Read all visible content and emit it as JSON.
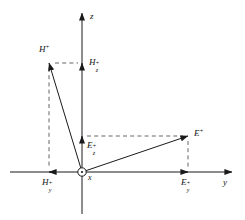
{
  "figure": {
    "background_color": "#ffffff",
    "line_color": "#1a1a1a",
    "dash_color": "#555555",
    "width": 245,
    "height": 220
  },
  "axes": {
    "vertical": {
      "name": "z",
      "label": "z",
      "label_x": 90,
      "label_y": 12,
      "x": 82,
      "top_y": 13,
      "bottom_y": 214,
      "arrow": "up"
    },
    "horizontal": {
      "name": "y",
      "label": "y",
      "label_x": 223,
      "label_y": 178,
      "y": 172,
      "left_x": 10,
      "right_x": 232,
      "arrow": "right"
    },
    "out_of_page": {
      "name": "x",
      "label": "x",
      "label_x": 88,
      "label_y": 174,
      "symbol": "circle-dot",
      "cx": 82,
      "cy": 172,
      "r": 4.2
    }
  },
  "vectors": [
    {
      "name": "H-plus",
      "label_base": "H",
      "label_sup": "+",
      "label_sub": "",
      "label_x": 39,
      "label_y": 44,
      "from_x": 82,
      "from_y": 172,
      "to_x": 49,
      "to_y": 63
    },
    {
      "name": "E-plus",
      "label_base": "E",
      "label_sup": "+",
      "label_sub": "",
      "label_x": 194,
      "label_y": 128,
      "from_x": 82,
      "from_y": 172,
      "to_x": 188,
      "to_y": 136
    }
  ],
  "components": [
    {
      "name": "Hz-plus",
      "label_base": "H",
      "label_sub": "z",
      "label_sup": "+",
      "label_x": 89,
      "label_y": 58,
      "tip_x": 82,
      "tip_y": 63,
      "direction": "up",
      "axis": "z"
    },
    {
      "name": "Hy-plus",
      "label_base": "H",
      "label_sub": "y",
      "label_sup": "+",
      "label_x": 42,
      "label_y": 178,
      "tip_x": 49,
      "tip_y": 172,
      "direction": "left",
      "axis": "y"
    },
    {
      "name": "Ez-plus",
      "label_base": "E",
      "label_sub": "z",
      "label_sup": "+",
      "label_x": 87,
      "label_y": 141,
      "tip_x": 82,
      "tip_y": 136,
      "direction": "up",
      "axis": "z"
    },
    {
      "name": "Ey-plus",
      "label_base": "E",
      "label_sub": "y",
      "label_sup": "+",
      "label_x": 181,
      "label_y": 178,
      "tip_x": 188,
      "tip_y": 172,
      "direction": "right",
      "axis": "y"
    }
  ],
  "dashed_projections": [
    {
      "name": "h-tip-to-z-axis",
      "x1": 55,
      "y1": 63,
      "x2": 78,
      "y2": 63
    },
    {
      "name": "h-tip-to-y-axis",
      "x1": 49,
      "y1": 68,
      "x2": 49,
      "y2": 168
    },
    {
      "name": "e-tip-to-z-axis",
      "x1": 87,
      "y1": 136,
      "x2": 183,
      "y2": 136
    },
    {
      "name": "e-tip-to-y-axis",
      "x1": 188,
      "y1": 141,
      "x2": 188,
      "y2": 168
    }
  ]
}
